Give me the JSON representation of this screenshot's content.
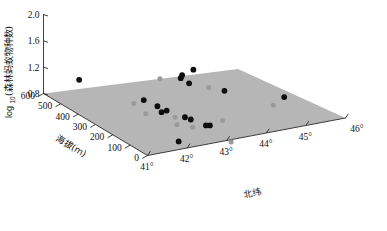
{
  "chart_data": {
    "type": "scatter",
    "title": "",
    "subtitle": "",
    "projection": "3d",
    "grid": false,
    "legend": null,
    "zlabel_prefix": "log",
    "zlabel_sub": "10",
    "zlabel_rest": "(森林蚂蚁物种数)",
    "zlabel_full": "log10(森林蚂蚁物种数)",
    "xlabel": "北纬",
    "ylabel": "海拔(m)",
    "z_ticks": [
      "0.8",
      "1.2",
      "1.6",
      "2.0"
    ],
    "z_tick_values": [
      0.8,
      1.2,
      1.6,
      2.0
    ],
    "zlim": [
      0.8,
      2.0
    ],
    "x_ticks": [
      "41°",
      "42°",
      "43°",
      "44°",
      "45°",
      "46°"
    ],
    "x_tick_values": [
      41,
      42,
      43,
      44,
      45,
      46
    ],
    "xlim": [
      41,
      46
    ],
    "y_ticks": [
      "0",
      "100",
      "200",
      "300",
      "400",
      "500",
      "600"
    ],
    "y_tick_values": [
      0,
      100,
      200,
      300,
      400,
      500,
      600
    ],
    "ylim": [
      0,
      600
    ],
    "surface": {
      "description": "fitted regression plane",
      "color": "#b6b6b6",
      "corner_values": {
        "lat41_elev0": 0.86,
        "lat46_elev0": 0.8,
        "lat41_elev600": 1.05,
        "lat46_elev600": 0.96
      }
    },
    "points": [
      {
        "lat": 41.55,
        "elev": 520,
        "z": 1.07
      },
      {
        "lat": 42.35,
        "elev": 330,
        "z": 0.97
      },
      {
        "lat": 42.52,
        "elev": 290,
        "z": 0.92
      },
      {
        "lat": 42.45,
        "elev": 250,
        "z": 0.9
      },
      {
        "lat": 42.6,
        "elev": 255,
        "z": 0.9
      },
      {
        "lat": 42.8,
        "elev": 195,
        "z": 0.87
      },
      {
        "lat": 42.86,
        "elev": 175,
        "z": 0.86
      },
      {
        "lat": 43.0,
        "elev": 120,
        "z": 0.84
      },
      {
        "lat": 43.08,
        "elev": 115,
        "z": 0.84
      },
      {
        "lat": 43.7,
        "elev": 425,
        "z": 1.0
      },
      {
        "lat": 43.8,
        "elev": 440,
        "z": 1.01
      },
      {
        "lat": 43.78,
        "elev": 395,
        "z": 0.96
      },
      {
        "lat": 44.15,
        "elev": 455,
        "z": 1.03
      },
      {
        "lat": 44.3,
        "elev": 310,
        "z": 0.92
      },
      {
        "lat": 45.35,
        "elev": 205,
        "z": 0.87
      },
      {
        "lat": 42.05,
        "elev": 60,
        "z": 0.8
      }
    ],
    "shadow_points": [
      {
        "lat": 42.1,
        "elev": 330
      },
      {
        "lat": 42.05,
        "elev": 250
      },
      {
        "lat": 42.38,
        "elev": 145
      },
      {
        "lat": 42.55,
        "elev": 195
      },
      {
        "lat": 42.62,
        "elev": 110
      },
      {
        "lat": 43.35,
        "elev": 465
      },
      {
        "lat": 43.42,
        "elev": 120
      },
      {
        "lat": 44.1,
        "elev": 355
      },
      {
        "lat": 44.9,
        "elev": 165
      },
      {
        "lat": 42.98,
        "elev": -30
      }
    ],
    "colors": {
      "point": "#0d0d0d",
      "shadow": "#9a9a9a",
      "plane": "#b6b6b6",
      "axis": "#2b2b2b",
      "background": "#ffffff"
    }
  }
}
